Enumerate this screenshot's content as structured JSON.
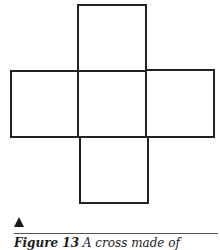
{
  "figure": {
    "stroke_color": "#222222",
    "squares": [
      {
        "id": "top",
        "x": 78,
        "y": 5,
        "w": 68,
        "h": 66
      },
      {
        "id": "left",
        "x": 11,
        "y": 71,
        "w": 67,
        "h": 66
      },
      {
        "id": "center",
        "x": 78,
        "y": 71,
        "w": 68,
        "h": 66
      },
      {
        "id": "right",
        "x": 146,
        "y": 70,
        "w": 68,
        "h": 67
      },
      {
        "id": "bottom",
        "x": 80,
        "y": 137,
        "w": 68,
        "h": 66
      }
    ]
  },
  "caption": {
    "label": "Figure 13",
    "text": " A cross made of"
  }
}
